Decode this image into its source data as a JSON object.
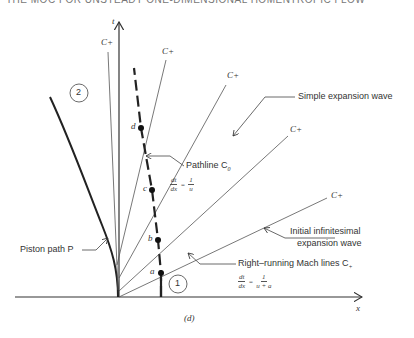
{
  "header": {
    "title": "THE MOC FOR UNSTEADY ONE-DIMENSIONAL HOMENTROPIC FLOW"
  },
  "axes": {
    "t_label": "t",
    "x_label": "x"
  },
  "regions": {
    "region1": "1",
    "region2": "2"
  },
  "points": {
    "a": "a",
    "b": "b",
    "c": "c",
    "d": "d"
  },
  "characteristics": {
    "c_plus_labels": [
      "C+",
      "C+",
      "C+",
      "C+",
      "C+"
    ]
  },
  "annotations": {
    "simple_wave": "Simple expansion wave",
    "pathline": "Pathline C",
    "pathline_sub": "0",
    "pathline_eq": {
      "num": "dt",
      "den": "dx",
      "eq": "=",
      "rnum": "1",
      "rden": "u"
    },
    "initial_wave_1": "Initial infinitesimal",
    "initial_wave_2": "expansion wave",
    "mach_lines": "Right–running Mach lines C",
    "mach_sub": "+",
    "mach_eq": {
      "num": "dt",
      "den": "dx",
      "eq": "=",
      "rnum": "1",
      "rden": "u + a"
    },
    "piston": "Piston path P"
  },
  "caption": "(d)"
}
